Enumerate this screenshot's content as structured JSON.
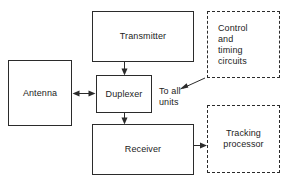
{
  "diagram": {
    "background_color": "#ffffff",
    "line_color": "#2b2b2b",
    "text_color": "#1c1c1c",
    "nodes": [
      {
        "id": "antenna",
        "label": "Antenna",
        "style": "solid",
        "x": 8,
        "y": 60,
        "width": 64,
        "height": 66
      },
      {
        "id": "transmitter",
        "label": "Transmitter",
        "style": "solid",
        "x": 92,
        "y": 11,
        "width": 102,
        "height": 51
      },
      {
        "id": "duplexer",
        "label": "Duplexer",
        "style": "solid",
        "x": 96,
        "y": 75,
        "width": 56,
        "height": 38
      },
      {
        "id": "receiver",
        "label": "Receiver",
        "style": "solid",
        "x": 92,
        "y": 124,
        "width": 102,
        "height": 51
      },
      {
        "id": "control-timing-circuits",
        "label": "Control\nand\ntiming\ncircuits",
        "style": "dashed",
        "x": 207,
        "y": 11,
        "width": 73,
        "height": 67
      },
      {
        "id": "tracking-processor",
        "label": "Tracking\nprocessor",
        "style": "dashed",
        "x": 207,
        "y": 105,
        "width": 73,
        "height": 68
      }
    ],
    "free_labels": [
      {
        "id": "to-all-units",
        "text": "To all\nunits",
        "x": 159,
        "y": 86
      }
    ],
    "connections": [
      {
        "id": "transmitter-to-duplexer",
        "from": "transmitter",
        "to": "duplexer",
        "direction": "down"
      },
      {
        "id": "antenna-to-duplexer",
        "from": "antenna",
        "to": "duplexer",
        "direction": "bidirectional"
      },
      {
        "id": "duplexer-to-receiver",
        "from": "duplexer",
        "to": "receiver",
        "direction": "down"
      },
      {
        "id": "receiver-to-tracking-processor",
        "from": "receiver",
        "to": "tracking-processor",
        "direction": "right"
      },
      {
        "id": "control-to-all-units",
        "from": "control-timing-circuits",
        "to": "to-all-units",
        "direction": "down-left"
      }
    ]
  }
}
